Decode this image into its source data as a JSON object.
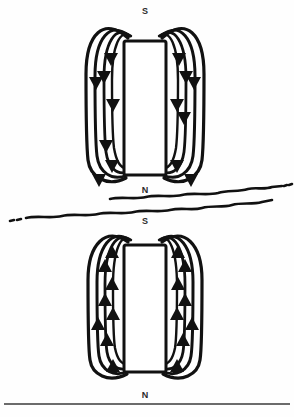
{
  "figure": {
    "background_color": "#fefefe",
    "ink_color": "#111111",
    "width": 294,
    "height": 417
  },
  "magnets": [
    {
      "id": "upper-magnet",
      "top_pole_label": "S",
      "bottom_pole_label": "N",
      "body": {
        "x": 124,
        "y": 41,
        "width": 42,
        "height": 134
      },
      "fill_color": "#ffffff",
      "outline_color": "#111111"
    },
    {
      "id": "lower-magnet",
      "top_pole_label": "S",
      "bottom_pole_label": "N",
      "body": {
        "x": 124,
        "y": 245,
        "width": 42,
        "height": 127
      },
      "fill_color": "#ffffff",
      "outline_color": "#111111"
    }
  ],
  "labels": {
    "upper_magnet_top": "S",
    "upper_magnet_bottom": "N",
    "lower_magnet_top": "S",
    "lower_magnet_bottom": "N"
  },
  "field_lines": {
    "arrow_direction_upper_left": "down",
    "arrow_direction_upper_right": "down",
    "arrow_direction_lower_left": "up",
    "arrow_direction_lower_right": "up",
    "loops_per_side": 3,
    "stroke_color": "#111111"
  },
  "separator": {
    "id": "wavy-boundary",
    "style": "hand-drawn double wavy line",
    "upper_line_y": 196,
    "lower_line_y": 215,
    "color": "#111111"
  },
  "baseline": {
    "id": "bottom-rule",
    "y": 404,
    "color": "#3a3a3a"
  }
}
